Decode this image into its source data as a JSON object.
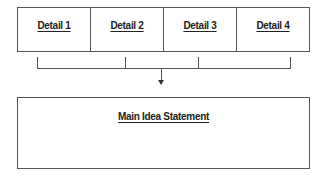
{
  "details": [
    {
      "label": "Detail 1"
    },
    {
      "label": "Detail 2"
    },
    {
      "label": "Detail 3"
    },
    {
      "label": "Detail 4"
    }
  ],
  "main_idea": {
    "label": "Main Idea Statement"
  }
}
